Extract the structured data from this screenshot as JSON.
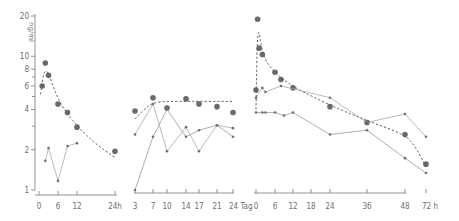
{
  "chart_data": {
    "type": "line",
    "title": "",
    "ylabel": "ng/ml",
    "yscale": "log",
    "ylim": [
      1,
      20
    ],
    "yticks": [
      1,
      2,
      4,
      6,
      8,
      10,
      20
    ],
    "ytick_labels": [
      "1",
      "2",
      "4",
      "6",
      "8",
      "10",
      "20"
    ],
    "grid": false,
    "legend": "none",
    "panels": [
      {
        "name": "panel-1",
        "unit": "h",
        "xlim": [
          0,
          24
        ],
        "xticks": [
          0,
          6,
          12,
          24
        ],
        "xtick_labels": [
          "0",
          "6",
          "12",
          "24h"
        ],
        "series": [
          {
            "name": "mean",
            "marker": "large-dot",
            "x": [
              1,
              2,
              3,
              6,
              9,
              12,
              24
            ],
            "y": [
              6.0,
              8.9,
              7.2,
              4.4,
              3.8,
              2.95,
              1.95
            ]
          },
          {
            "name": "individual",
            "marker": "small-dot",
            "connected": true,
            "x": [
              2,
              3,
              6,
              9,
              12
            ],
            "y": [
              1.65,
              2.06,
              1.17,
              2.13,
              2.24
            ]
          },
          {
            "name": "fit",
            "style": "dashed",
            "x": [
              0.5,
              2,
              6,
              12,
              18,
              24
            ],
            "y": [
              5.2,
              9.0,
              4.6,
              3.0,
              2.2,
              1.75
            ]
          }
        ]
      },
      {
        "name": "panel-2",
        "unit": "Tag",
        "xlim": [
          3,
          24
        ],
        "xticks": [
          3,
          7,
          10,
          14,
          17,
          21,
          24
        ],
        "xtick_labels": [
          "3",
          "7",
          "10",
          "14",
          "17",
          "21",
          "24 Tag"
        ],
        "series": [
          {
            "name": "mean",
            "marker": "large-dot",
            "x": [
              3,
              7,
              10,
              14,
              17,
              21,
              24
            ],
            "y": [
              3.9,
              4.9,
              4.1,
              4.8,
              4.4,
              4.2,
              3.8
            ]
          },
          {
            "name": "individual-a",
            "marker": "small-dot",
            "connected": true,
            "x": [
              3,
              7,
              10,
              14,
              17,
              21,
              24
            ],
            "y": [
              2.6,
              4.4,
              1.95,
              2.95,
              1.95,
              3.05,
              2.9
            ]
          },
          {
            "name": "individual-b",
            "marker": "small-dot",
            "connected": true,
            "x": [
              3,
              7,
              10,
              14,
              17,
              21,
              24
            ],
            "y": [
              1.0,
              2.5,
              4.0,
              2.5,
              2.8,
              3.05,
              2.5
            ]
          },
          {
            "name": "fit",
            "style": "dashed",
            "x": [
              3,
              5,
              7,
              10,
              14,
              17,
              21,
              24
            ],
            "y": [
              3.4,
              4.0,
              4.5,
              4.6,
              4.6,
              4.6,
              4.6,
              4.6
            ]
          }
        ]
      },
      {
        "name": "panel-3",
        "unit": "h",
        "xlim": [
          0,
          72
        ],
        "xticks": [
          0,
          6,
          12,
          18,
          24,
          36,
          48,
          72
        ],
        "xtick_labels": [
          "0",
          "6",
          "12",
          "18",
          "24",
          "36",
          "48",
          "72 h"
        ],
        "series": [
          {
            "name": "mean",
            "marker": "large-dot",
            "x": [
              0,
              0.5,
              1,
              2,
              6,
              8,
              12,
              24,
              36,
              48,
              72
            ],
            "y": [
              5.6,
              18.9,
              11.5,
              10.3,
              7.6,
              6.7,
              5.8,
              4.2,
              3.2,
              2.6,
              1.56
            ]
          },
          {
            "name": "individual-a",
            "marker": "small-dot",
            "connected": true,
            "x": [
              0,
              2,
              3,
              8,
              24,
              36,
              48,
              72
            ],
            "y": [
              4.9,
              5.8,
              5.4,
              6.0,
              4.9,
              3.2,
              3.7,
              2.5
            ]
          },
          {
            "name": "individual-b",
            "marker": "small-dot",
            "connected": true,
            "x": [
              0,
              2,
              3,
              6,
              9,
              12,
              24,
              36,
              48,
              72
            ],
            "y": [
              3.8,
              3.8,
              3.8,
              3.8,
              3.6,
              3.8,
              2.6,
              2.8,
              1.73,
              1.34
            ]
          },
          {
            "name": "fit",
            "style": "dashed",
            "x": [
              0,
              0.5,
              2,
              6,
              12,
              24,
              36,
              48,
              60,
              72
            ],
            "y": [
              4.0,
              18.9,
              10.0,
              7.5,
              5.9,
              4.3,
              3.3,
              2.6,
              2.1,
              1.5
            ]
          }
        ]
      }
    ]
  }
}
